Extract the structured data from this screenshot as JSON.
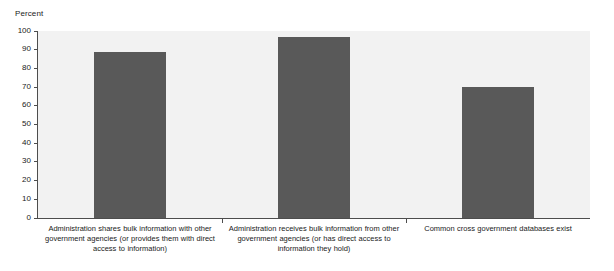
{
  "chart_data": {
    "type": "bar",
    "title": "",
    "subtitle": "",
    "xlabel": "",
    "ylabel": "Percent",
    "ylim": [
      0,
      100
    ],
    "grid": false,
    "legend": null,
    "orientation": "vertical",
    "bar_color": "#595959",
    "plot_background": "#f2f2f2",
    "axis_color": "#4d4d4d",
    "categories": [
      "Administration shares bulk information with other government agencies (or provides them with direct access to information)",
      "Administration receives bulk information from other government agencies (or has direct access to information they hold)",
      "Common cross government databases exist"
    ],
    "values": [
      89,
      97,
      70
    ],
    "yticks": [
      0,
      10,
      20,
      30,
      40,
      50,
      60,
      70,
      80,
      90,
      100
    ],
    "ytick_labels": [
      "0",
      "10",
      "20",
      "30",
      "40",
      "50",
      "60",
      "70",
      "80",
      "90",
      "100"
    ]
  }
}
